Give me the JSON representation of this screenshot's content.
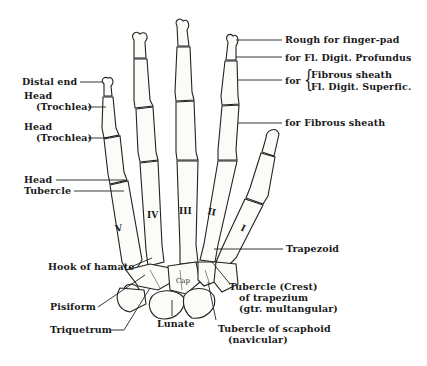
{
  "figure": {
    "background": "#ffffff",
    "ink_color": "#1a1a1a"
  },
  "labels": {
    "left": {
      "distal_end": "Distal end",
      "head_trochlea_1_line1": "Head",
      "head_trochlea_1_line2": "(Trochlea)",
      "head_trochlea_2_line1": "Head",
      "head_trochlea_2_line2": "(Trochlea)",
      "head": "Head",
      "tubercle": "Tubercle",
      "hook_of_hamate": "Hook of hamate",
      "pisiform": "Pisiform",
      "triquetrum": "Triquetrum"
    },
    "right": {
      "rough_finger_pad": "Rough for finger-pad",
      "fl_digit_profundus": "for Fl. Digit. Profundus",
      "for_prefix": "for",
      "fibrous_sheath_a": "Fibrous sheath",
      "fl_digit_superfic": "Fl. Digit. Superfic.",
      "for_fibrous_sheath": "for Fibrous sheath",
      "trapezoid": "Trapezoid",
      "tubercle_trapezium_line1": "Tubercle (Crest)",
      "tubercle_trapezium_line2": "of trapezium",
      "tubercle_trapezium_line3": "(gtr. multangular)",
      "tubercle_scaphoid_line1": "Tubercle of scaphoid",
      "tubercle_scaphoid_line2": "(navicular)"
    },
    "bottom": {
      "lunate": "Lunate"
    },
    "metacarpals": [
      "I",
      "II",
      "III",
      "IV",
      "V"
    ],
    "capitate_abbrev": "Cap"
  }
}
